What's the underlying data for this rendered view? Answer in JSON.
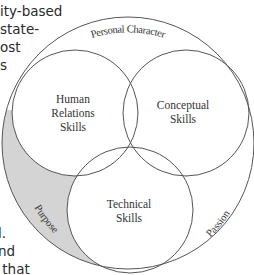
{
  "diagram": {
    "type": "venn",
    "outer_label_top": "Personal Character",
    "outer_label_left": "Purpose",
    "outer_label_right": "Passion",
    "circles": [
      {
        "label_lines": [
          "Human",
          "Relations",
          "Skills"
        ]
      },
      {
        "label_lines": [
          "Conceptual",
          "Skills"
        ]
      },
      {
        "label_lines": [
          "Technical",
          "Skills"
        ]
      }
    ],
    "colors": {
      "stroke": "#555555",
      "shade": "#d4d4d4",
      "text": "#333333"
    }
  },
  "cropped_text": {
    "left_top": [
      "ity-based",
      "state-",
      "ost",
      "s"
    ],
    "left_bottom": [
      "l.",
      "nd",
      " that"
    ]
  }
}
